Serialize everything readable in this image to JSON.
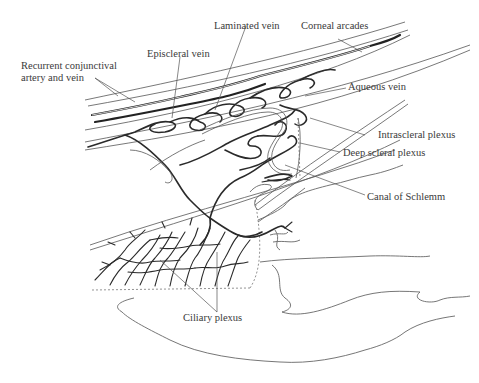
{
  "figure": {
    "labels": {
      "recurrent_line1": "Recurrent conjunctival",
      "recurrent_line2": "artery and vein",
      "episcleral_vein": "Episcleral vein",
      "laminated_vein": "Laminated vein",
      "corneal_arcades": "Corneal arcades",
      "aqueous_vein": "Aqueous vein",
      "intrascleral_plexus": "Intrascleral plexus",
      "deep_scleral_plexus": "Deep scleral plexus",
      "canal_of_schlemm": "Canal of Schlemm",
      "ciliary_plexus": "Ciliary plexus"
    },
    "colors": {
      "background": "#ffffff",
      "line": "#2a2a2a",
      "text": "#3a3a3a"
    }
  }
}
